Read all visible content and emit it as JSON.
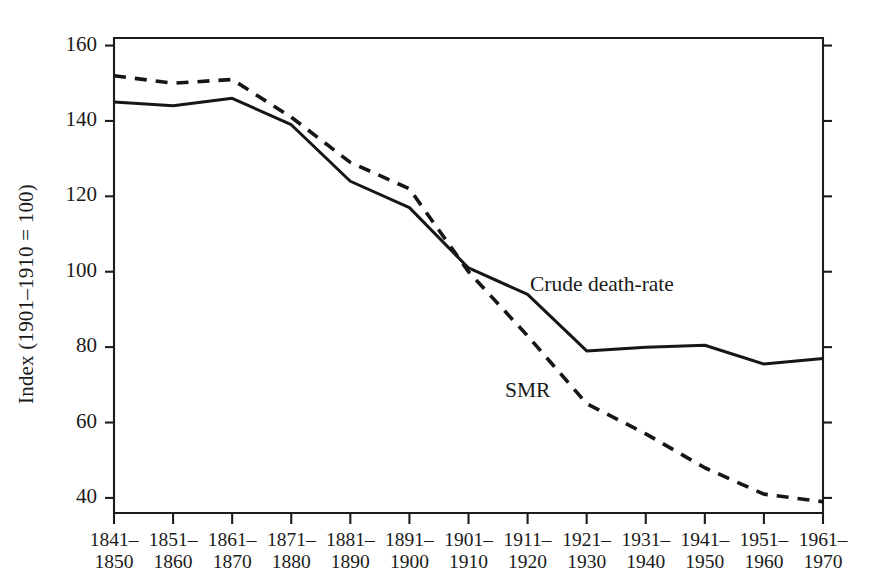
{
  "chart_data": {
    "type": "line",
    "title": "",
    "xlabel": "",
    "ylabel": "Index (1901–1910 = 100)",
    "categories": [
      "1841–\n1850",
      "1851–\n1860",
      "1861–\n1870",
      "1871–\n1880",
      "1881–\n1890",
      "1891–\n1900",
      "1901–\n1910",
      "1911–\n1920",
      "1921–\n1930",
      "1931–\n1940",
      "1941–\n1950",
      "1951–\n1960",
      "1961–\n1970"
    ],
    "categories_lines": [
      [
        "1841–",
        "1850"
      ],
      [
        "1851–",
        "1860"
      ],
      [
        "1861–",
        "1870"
      ],
      [
        "1871–",
        "1880"
      ],
      [
        "1881–",
        "1890"
      ],
      [
        "1891–",
        "1900"
      ],
      [
        "1901–",
        "1910"
      ],
      [
        "1911–",
        "1920"
      ],
      [
        "1921–",
        "1930"
      ],
      [
        "1931–",
        "1940"
      ],
      [
        "1941–",
        "1950"
      ],
      [
        "1951–",
        "1960"
      ],
      [
        "1961–",
        "1970"
      ]
    ],
    "series": [
      {
        "name": "Crude death-rate",
        "style": "solid",
        "color": "#161616",
        "values": [
          145,
          144,
          146,
          139,
          124,
          117,
          101,
          94,
          79,
          80,
          80.5,
          75.5,
          77
        ]
      },
      {
        "name": "SMR",
        "style": "dashed",
        "color": "#161616",
        "values": [
          152,
          150,
          151,
          141,
          129,
          122,
          100,
          83,
          65,
          57,
          48,
          41,
          39
        ]
      }
    ],
    "ylim": [
      36,
      162
    ],
    "yticks": [
      40,
      60,
      80,
      100,
      120,
      140,
      160
    ],
    "ytick_labels": [
      "40",
      "60",
      "80",
      "100",
      "120",
      "140",
      "160"
    ],
    "grid": false,
    "legend": "inline-annotations",
    "annotations": [
      {
        "text": "Crude death-rate",
        "category": "1911–1920",
        "value": 94
      },
      {
        "text": "SMR",
        "category": "1921–1930",
        "value": 66
      }
    ]
  }
}
